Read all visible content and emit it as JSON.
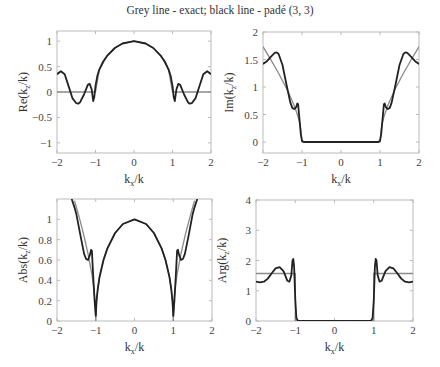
{
  "title": "Grey line - exact; black line - padé (3, 3)",
  "colors": {
    "exact": "#8a8a8a",
    "pade": "#222222",
    "axes": "#bbbbbb"
  },
  "chart_data": [
    {
      "type": "line",
      "name": "re",
      "title": "",
      "xlabel": "k_x/k",
      "ylabel": "Re(k_z/k)",
      "xlim": [
        -2,
        2
      ],
      "ylim": [
        -1.2,
        1.2
      ],
      "xticks": [
        -2,
        -1,
        0,
        1,
        2
      ],
      "xtick_labels": [
        "−2",
        "−1",
        "0",
        "1",
        "2"
      ],
      "yticks": [
        -1,
        -0.5,
        0,
        0.5,
        1
      ],
      "ytick_labels": [
        "−1",
        "−0.5",
        "0",
        "0.5",
        "1"
      ],
      "box": [
        57,
        31,
        211,
        153
      ],
      "series": [
        {
          "name": "exact",
          "x": [
            -2,
            -1,
            -1,
            -0.9,
            -0.7,
            -0.5,
            -0.3,
            0,
            0.3,
            0.5,
            0.7,
            0.9,
            1,
            1,
            2
          ],
          "y": [
            0,
            0,
            0,
            0.436,
            0.714,
            0.866,
            0.954,
            1,
            0.954,
            0.866,
            0.714,
            0.436,
            0,
            0,
            0
          ]
        },
        {
          "name": "pade",
          "x": [
            -2,
            -1.9,
            -1.8,
            -1.7,
            -1.6,
            -1.5,
            -1.45,
            -1.4,
            -1.3,
            -1.2,
            -1.15,
            -1.1,
            -1.06,
            -1.03,
            -1.0,
            -0.95,
            -0.9,
            -0.8,
            -0.7,
            -0.5,
            -0.3,
            0,
            0.3,
            0.5,
            0.7,
            0.8,
            0.9,
            0.95,
            1.0,
            1.03,
            1.06,
            1.1,
            1.15,
            1.2,
            1.3,
            1.4,
            1.45,
            1.5,
            1.6,
            1.7,
            1.8,
            1.9,
            2
          ],
          "y": [
            0.35,
            0.41,
            0.35,
            0.12,
            -0.12,
            -0.22,
            -0.23,
            -0.2,
            -0.05,
            0.14,
            0.16,
            0.05,
            -0.18,
            -0.1,
            0.12,
            0.32,
            0.44,
            0.6,
            0.71,
            0.866,
            0.954,
            1,
            0.954,
            0.866,
            0.71,
            0.6,
            0.44,
            0.32,
            0.12,
            -0.1,
            -0.18,
            0.05,
            0.16,
            0.14,
            -0.05,
            -0.2,
            -0.23,
            -0.22,
            -0.12,
            0.12,
            0.35,
            0.41,
            0.35
          ]
        }
      ]
    },
    {
      "type": "line",
      "name": "im",
      "title": "",
      "xlabel": "k_x/k",
      "ylabel": "Im(k_z/k)",
      "xlim": [
        -2,
        2
      ],
      "ylim": [
        -0.2,
        2
      ],
      "xticks": [
        -2,
        -1,
        0,
        1,
        2
      ],
      "xtick_labels": [
        "−2",
        "−1",
        "0",
        "1",
        "2"
      ],
      "yticks": [
        0,
        0.5,
        1,
        1.5,
        2
      ],
      "ytick_labels": [
        "0",
        "0.5",
        "1",
        "1.5",
        "2"
      ],
      "box": [
        263,
        32,
        419,
        153
      ],
      "series": [
        {
          "name": "exact",
          "x": [
            -2,
            -1.8,
            -1.6,
            -1.4,
            -1.2,
            -1.1,
            -1.05,
            -1.0,
            1.0,
            1.05,
            1.1,
            1.2,
            1.4,
            1.6,
            1.8,
            2
          ],
          "y": [
            1.732,
            1.497,
            1.249,
            0.98,
            0.663,
            0.458,
            0.32,
            0,
            0,
            0.32,
            0.458,
            0.663,
            0.98,
            1.249,
            1.497,
            1.732
          ]
        },
        {
          "name": "pade",
          "x": [
            -2,
            -1.9,
            -1.8,
            -1.7,
            -1.65,
            -1.6,
            -1.5,
            -1.4,
            -1.3,
            -1.25,
            -1.2,
            -1.15,
            -1.12,
            -1.1,
            -1.07,
            -1.03,
            -1.0,
            -0.95,
            0.95,
            1.0,
            1.03,
            1.07,
            1.1,
            1.12,
            1.15,
            1.2,
            1.25,
            1.3,
            1.4,
            1.5,
            1.6,
            1.65,
            1.7,
            1.8,
            1.9,
            2
          ],
          "y": [
            1.42,
            1.47,
            1.55,
            1.62,
            1.63,
            1.6,
            1.4,
            1.05,
            0.72,
            0.62,
            0.6,
            0.63,
            0.7,
            0.69,
            0.45,
            0.15,
            0.02,
            0,
            0,
            0.02,
            0.15,
            0.45,
            0.69,
            0.7,
            0.63,
            0.6,
            0.62,
            0.72,
            1.05,
            1.4,
            1.6,
            1.63,
            1.62,
            1.55,
            1.47,
            1.42
          ]
        }
      ]
    },
    {
      "type": "line",
      "name": "abs",
      "title": "",
      "xlabel": "k_x/k",
      "ylabel": "Abs(k_z/k)",
      "xlim": [
        -2,
        2
      ],
      "ylim": [
        0,
        1.2
      ],
      "xticks": [
        -2,
        -1,
        0,
        1,
        2
      ],
      "xtick_labels": [
        "−2",
        "−1",
        "0",
        "1",
        "2"
      ],
      "yticks": [
        0,
        0.2,
        0.4,
        0.6,
        0.8,
        1
      ],
      "ytick_labels": [
        "0",
        "0.2",
        "0.4",
        "0.6",
        "0.8",
        "1"
      ],
      "box": [
        57,
        199,
        212,
        321
      ],
      "series": [
        {
          "name": "exact",
          "x": [
            -1.55,
            -1.5,
            -1.4,
            -1.3,
            -1.2,
            -1.1,
            -1.05,
            -1.02,
            -1.0,
            -0.98,
            -0.95,
            -0.9,
            -0.8,
            -0.7,
            -0.5,
            -0.3,
            0,
            0.3,
            0.5,
            0.7,
            0.8,
            0.9,
            0.95,
            0.98,
            1.0,
            1.02,
            1.05,
            1.1,
            1.2,
            1.3,
            1.4,
            1.5,
            1.55
          ],
          "y": [
            1.184,
            1.118,
            0.98,
            0.831,
            0.663,
            0.458,
            0.32,
            0.2,
            0,
            0.199,
            0.312,
            0.436,
            0.6,
            0.714,
            0.866,
            0.954,
            1,
            0.954,
            0.866,
            0.714,
            0.6,
            0.436,
            0.312,
            0.199,
            0,
            0.2,
            0.32,
            0.458,
            0.663,
            0.831,
            0.98,
            1.118,
            1.184
          ]
        },
        {
          "name": "pade",
          "x": [
            -1.62,
            -1.55,
            -1.5,
            -1.4,
            -1.3,
            -1.25,
            -1.2,
            -1.15,
            -1.12,
            -1.1,
            -1.07,
            -1.03,
            -1.0,
            -0.98,
            -0.95,
            -0.9,
            -0.8,
            -0.7,
            -0.5,
            -0.3,
            0,
            0.3,
            0.5,
            0.7,
            0.8,
            0.9,
            0.95,
            0.98,
            1.0,
            1.03,
            1.07,
            1.1,
            1.12,
            1.15,
            1.2,
            1.25,
            1.3,
            1.4,
            1.5,
            1.55,
            1.62
          ],
          "y": [
            1.2,
            1.12,
            1.05,
            0.85,
            0.66,
            0.61,
            0.6,
            0.65,
            0.7,
            0.69,
            0.48,
            0.2,
            0.05,
            0.19,
            0.31,
            0.436,
            0.6,
            0.714,
            0.866,
            0.954,
            1,
            0.954,
            0.866,
            0.714,
            0.6,
            0.436,
            0.31,
            0.19,
            0.05,
            0.2,
            0.48,
            0.69,
            0.7,
            0.65,
            0.6,
            0.61,
            0.66,
            0.85,
            1.05,
            1.12,
            1.2
          ]
        }
      ]
    },
    {
      "type": "line",
      "name": "arg",
      "title": "",
      "xlabel": "k_x/k",
      "ylabel": "Arg(k_z/k)",
      "xlim": [
        -2,
        2
      ],
      "ylim": [
        0,
        4
      ],
      "xticks": [
        -2,
        -1,
        0,
        1,
        2
      ],
      "xtick_labels": [
        "−2",
        "−1",
        "0",
        "1",
        "2"
      ],
      "yticks": [
        0,
        1,
        2,
        3,
        4
      ],
      "ytick_labels": [
        "0",
        "1",
        "2",
        "3",
        "4"
      ],
      "box": [
        256,
        200,
        413,
        321
      ],
      "series": [
        {
          "name": "exact",
          "x": [
            -2,
            -1.0,
            -1.0,
            1.0,
            1.0,
            2
          ],
          "y": [
            1.571,
            1.571,
            0,
            0,
            1.571,
            1.571
          ]
        },
        {
          "name": "pade",
          "x": [
            -2,
            -1.9,
            -1.8,
            -1.7,
            -1.6,
            -1.5,
            -1.4,
            -1.3,
            -1.2,
            -1.15,
            -1.1,
            -1.07,
            -1.05,
            -1.03,
            -1.0,
            -0.97,
            -0.93,
            0.93,
            0.97,
            1.0,
            1.03,
            1.05,
            1.07,
            1.1,
            1.15,
            1.2,
            1.3,
            1.4,
            1.5,
            1.6,
            1.7,
            1.8,
            1.9,
            2
          ],
          "y": [
            1.3,
            1.28,
            1.3,
            1.4,
            1.58,
            1.74,
            1.78,
            1.65,
            1.33,
            1.3,
            1.5,
            2.0,
            2.05,
            1.8,
            0.7,
            0.1,
            0,
            0,
            0.1,
            0.7,
            1.8,
            2.05,
            2.0,
            1.5,
            1.3,
            1.33,
            1.65,
            1.78,
            1.74,
            1.58,
            1.4,
            1.3,
            1.28,
            1.3
          ]
        }
      ]
    }
  ]
}
